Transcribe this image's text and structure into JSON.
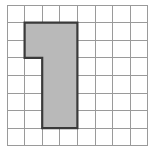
{
  "figure": {
    "background_color": "#ffffff"
  },
  "grid": {
    "columns": 8,
    "rows": 8,
    "origin_x": 7,
    "origin_y": 5,
    "cell_width": 17.6,
    "cell_height": 17.6,
    "line_color": "#9a9a9a",
    "line_width": 1,
    "show_labels": false
  },
  "shape": {
    "name": "shaded-region",
    "fill_color": "#b9b9b9",
    "outline_color": "#3a3a3a",
    "outline_width": 2.2,
    "area_cells": 14,
    "perimeter_cells": 20,
    "vertices_grid": [
      [
        1,
        1
      ],
      [
        4,
        1
      ],
      [
        4,
        7
      ],
      [
        2,
        7
      ],
      [
        2,
        3
      ],
      [
        1,
        3
      ]
    ],
    "filled_cells": [
      [
        1,
        1
      ],
      [
        2,
        1
      ],
      [
        3,
        1
      ],
      [
        1,
        2
      ],
      [
        2,
        2
      ],
      [
        3,
        2
      ],
      [
        2,
        3
      ],
      [
        3,
        3
      ],
      [
        2,
        4
      ],
      [
        3,
        4
      ],
      [
        2,
        5
      ],
      [
        3,
        5
      ],
      [
        2,
        6
      ],
      [
        3,
        6
      ]
    ],
    "segments": [
      {
        "name": "top-bar",
        "columns": 3,
        "rows": 2
      },
      {
        "name": "vertical-stem",
        "columns": 2,
        "rows": 4
      }
    ]
  }
}
